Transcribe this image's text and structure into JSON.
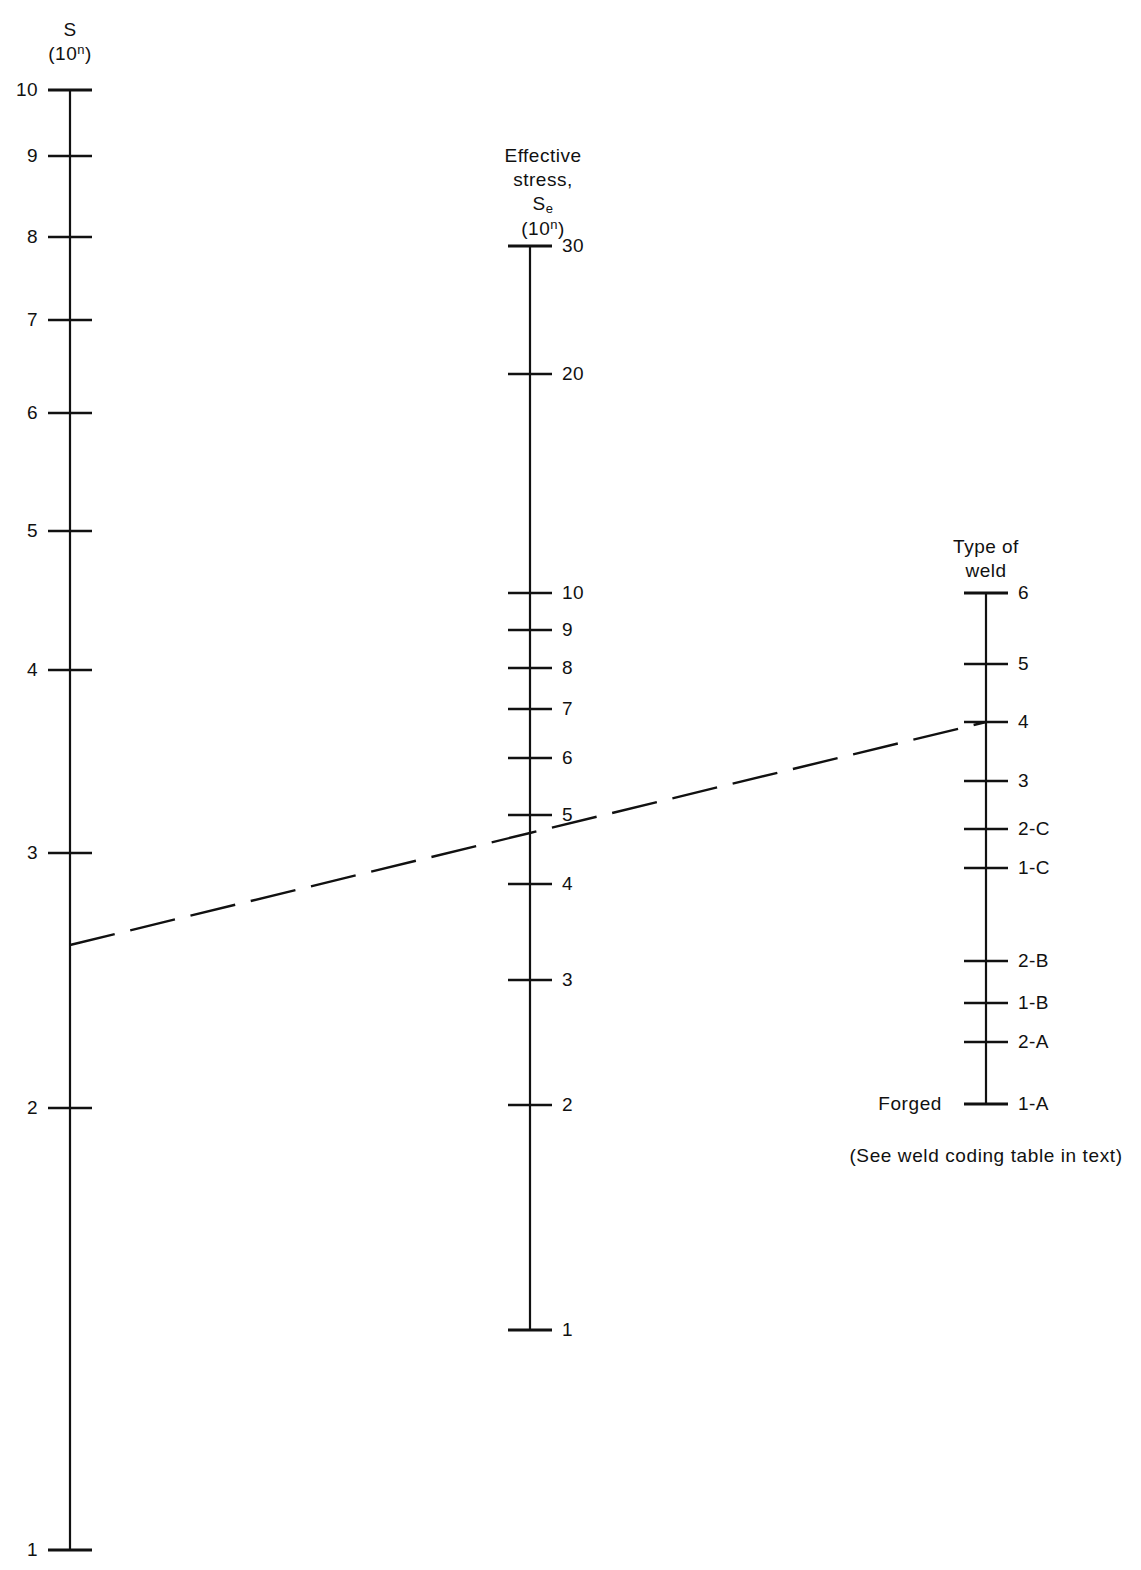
{
  "figure": {
    "type": "nomogram",
    "background": "#ffffff",
    "ink_color": "#111111",
    "width": 1141,
    "height": 1570
  },
  "chart_data": {
    "type": "nomogram",
    "title": "",
    "subtitle": "",
    "grid": false,
    "legend": null,
    "footnote": "(See weld coding table in text)",
    "scales": [
      {
        "id": "S",
        "name": "S",
        "header_lines": [
          "S",
          "(10n)"
        ],
        "header_plain": "S (10^n)",
        "axis_x": 70,
        "label_side": "left",
        "scale_kind": "logarithmic",
        "domain": [
          1,
          10
        ],
        "ticks": [
          {
            "label": "10",
            "value": 10,
            "y": 90
          },
          {
            "label": "9",
            "value": 9,
            "y": 156
          },
          {
            "label": "8",
            "value": 8,
            "y": 237
          },
          {
            "label": "7",
            "value": 7,
            "y": 320
          },
          {
            "label": "6",
            "value": 6,
            "y": 413
          },
          {
            "label": "5",
            "value": 5,
            "y": 531
          },
          {
            "label": "4",
            "value": 4,
            "y": 670
          },
          {
            "label": "3",
            "value": 3,
            "y": 853
          },
          {
            "label": "2",
            "value": 2,
            "y": 1108
          },
          {
            "label": "1",
            "value": 1,
            "y": 1550
          }
        ]
      },
      {
        "id": "Se",
        "name": "Effective stress, Se",
        "header_lines": [
          "Effective",
          "stress,",
          "Se",
          "(10n)"
        ],
        "header_plain": "Effective stress, Se (10^n)",
        "axis_x": 530,
        "label_side": "right",
        "scale_kind": "logarithmic",
        "domain": [
          1,
          30
        ],
        "ticks": [
          {
            "label": "30",
            "value": 30,
            "y": 246
          },
          {
            "label": "20",
            "value": 20,
            "y": 374
          },
          {
            "label": "10",
            "value": 10,
            "y": 593
          },
          {
            "label": "9",
            "value": 9,
            "y": 630
          },
          {
            "label": "8",
            "value": 8,
            "y": 668
          },
          {
            "label": "7",
            "value": 7,
            "y": 709
          },
          {
            "label": "6",
            "value": 6,
            "y": 758
          },
          {
            "label": "5",
            "value": 5,
            "y": 815
          },
          {
            "label": "4",
            "value": 4,
            "y": 884
          },
          {
            "label": "3",
            "value": 3,
            "y": 980
          },
          {
            "label": "2",
            "value": 2,
            "y": 1105
          },
          {
            "label": "1",
            "value": 1,
            "y": 1330
          }
        ]
      },
      {
        "id": "weld",
        "name": "Type of weld",
        "header_lines": [
          "Type of",
          "weld"
        ],
        "header_plain": "Type of weld",
        "axis_x": 986,
        "label_side": "right",
        "scale_kind": "categorical",
        "domain": [
          "1-A",
          "6"
        ],
        "ticks": [
          {
            "label": "6",
            "value": "6",
            "y": 593
          },
          {
            "label": "5",
            "value": "5",
            "y": 664
          },
          {
            "label": "4",
            "value": "4",
            "y": 722
          },
          {
            "label": "3",
            "value": "3",
            "y": 781
          },
          {
            "label": "2-C",
            "value": "2-C",
            "y": 829
          },
          {
            "label": "1-C",
            "value": "1-C",
            "y": 868
          },
          {
            "label": "2-B",
            "value": "2-B",
            "y": 961
          },
          {
            "label": "1-B",
            "value": "1-B",
            "y": 1003
          },
          {
            "label": "2-A",
            "value": "2-A",
            "y": 1042
          },
          {
            "label": "1-A",
            "value": "1-A",
            "y": 1104
          }
        ],
        "side_annotation": {
          "text": "Forged",
          "y": 1104
        }
      }
    ],
    "index_line": {
      "style": "dashed",
      "points": [
        {
          "scale": "S",
          "x": 70,
          "y": 945,
          "reading": "2.5"
        },
        {
          "scale": "Se",
          "x": 530,
          "y": 833,
          "reading": "4.7"
        },
        {
          "scale": "weld",
          "x": 986,
          "y": 722,
          "reading": "4"
        }
      ]
    }
  },
  "labels": {
    "scale_s_header_line1": "S",
    "scale_s_header_paren_open": "(10",
    "scale_s_header_exp": "n",
    "scale_s_header_paren_close": ")",
    "scale_se_header_line1": "Effective",
    "scale_se_header_line2": "stress,",
    "scale_se_header_sym": "S",
    "scale_se_header_sub": "e",
    "scale_weld_header_line1": "Type of",
    "scale_weld_header_line2": "weld",
    "forged": "Forged",
    "footnote": "(See weld coding table in text)"
  }
}
